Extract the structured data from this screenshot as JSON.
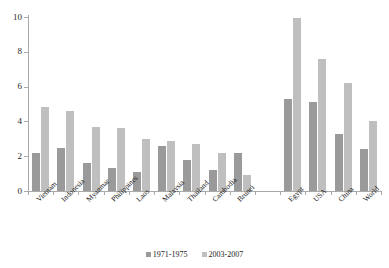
{
  "chart_data": {
    "type": "bar",
    "title": "",
    "subtitle": "",
    "xlabel": "",
    "ylabel": "",
    "ylim": [
      0,
      10
    ],
    "yticks": [
      0,
      2,
      4,
      6,
      8,
      10
    ],
    "grid": false,
    "legend_position": "bottom-center",
    "categories": [
      "Vietnam",
      "Indonesia",
      "Myanmar",
      "Philippines",
      "Laos",
      "Malaysia",
      "Thailand",
      "Cambodia",
      "Brunei",
      "",
      "Egypt",
      "USA",
      "China",
      "World"
    ],
    "series": [
      {
        "name": "1971-1975",
        "color": "#9a9a9a",
        "values": [
          2.2,
          2.5,
          1.6,
          1.3,
          1.1,
          2.6,
          1.8,
          1.2,
          2.2,
          null,
          5.3,
          5.1,
          3.3,
          2.4
        ]
      },
      {
        "name": "2003-2007",
        "color": "#bfbfbf",
        "values": [
          4.8,
          4.6,
          3.7,
          3.6,
          3.0,
          2.9,
          2.7,
          2.2,
          0.9,
          null,
          9.95,
          7.6,
          6.2,
          4.0
        ]
      }
    ]
  },
  "axes": {
    "y_tick_labels": [
      "0",
      "2",
      "4",
      "6",
      "8",
      "10"
    ]
  },
  "legend": {
    "items": [
      {
        "label": "1971-1975",
        "color": "#9a9a9a"
      },
      {
        "label": "2003-2007",
        "color": "#bfbfbf"
      }
    ]
  }
}
